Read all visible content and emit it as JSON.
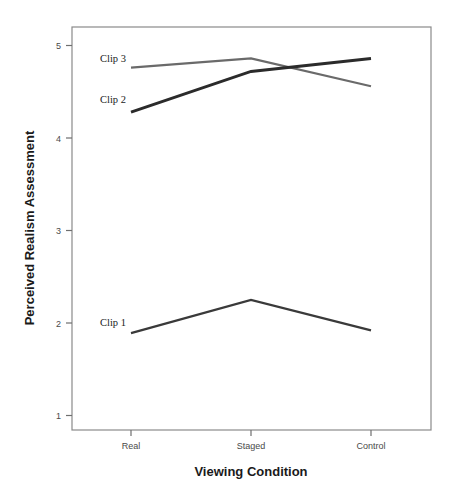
{
  "chart_data": {
    "type": "line",
    "title": "",
    "xlabel": "Viewing Condition",
    "ylabel": "Perceived Realism Assessment",
    "categories": [
      "Real",
      "Staged",
      "Control"
    ],
    "ylim": [
      1,
      5
    ],
    "yticks": [
      "1",
      "2",
      "3",
      "4",
      "5"
    ],
    "ytick_values": [
      1,
      2,
      3,
      4,
      5
    ],
    "grid": false,
    "legend": "inline-labels",
    "series": [
      {
        "name": "Clip 1",
        "values": [
          1.89,
          2.25,
          1.92
        ],
        "color": "#3a3a3a",
        "width": 2.2
      },
      {
        "name": "Clip 2",
        "values": [
          4.28,
          4.72,
          4.86
        ],
        "color": "#2b2b2b",
        "width": 3.0
      },
      {
        "name": "Clip 3",
        "values": [
          4.76,
          4.86,
          4.56
        ],
        "color": "#6a6a6a",
        "width": 2.2
      }
    ],
    "annotations": [
      {
        "text": "Clip 3",
        "series": "Clip 3"
      },
      {
        "text": "Clip 2",
        "series": "Clip 2"
      },
      {
        "text": "Clip 1",
        "series": "Clip 1"
      }
    ]
  },
  "axes": {
    "y_title": "Perceived Realism Assessment",
    "x_title": "Viewing Condition",
    "y_tick_labels": [
      "5",
      "4",
      "3",
      "2",
      "1"
    ],
    "x_tick_labels": [
      "Real",
      "Staged",
      "Control"
    ]
  }
}
